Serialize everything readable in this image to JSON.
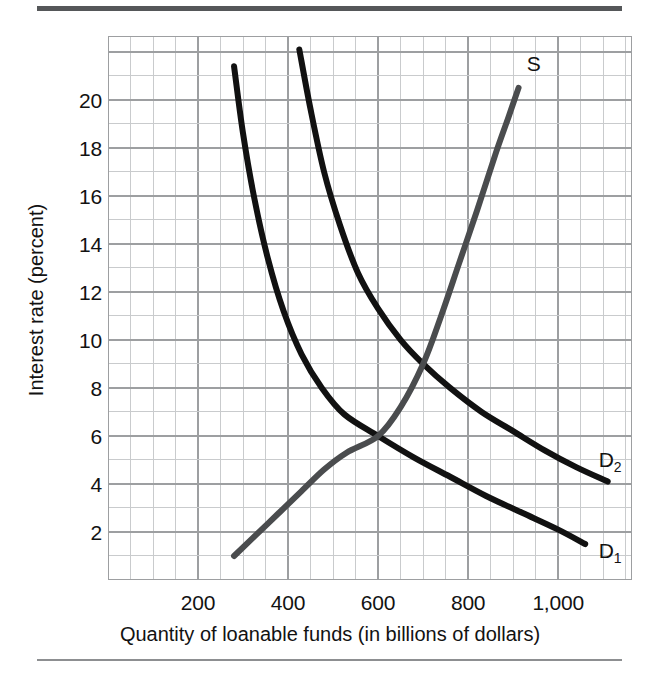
{
  "chart_data": {
    "type": "line",
    "title": "",
    "xlabel": "Quantity of loanable funds (in billions of dollars)",
    "ylabel": "Interest rate (percent)",
    "xlim": [
      0,
      1164
    ],
    "ylim": [
      0,
      22.66
    ],
    "xticks": [
      200,
      400,
      600,
      800,
      1000
    ],
    "xtick_labels": [
      "200",
      "400",
      "600",
      "800",
      "1,000"
    ],
    "yticks": [
      2,
      4,
      6,
      8,
      10,
      12,
      14,
      16,
      18,
      20
    ],
    "ytick_labels": [
      "2",
      "4",
      "6",
      "8",
      "10",
      "12",
      "14",
      "16",
      "18",
      "20"
    ],
    "grid": true,
    "grid_major_x_step": 200,
    "grid_major_y_step": 2,
    "grid_minor_x_step": 50,
    "grid_minor_y_step": 1,
    "legend_position": "inline-curve-end",
    "annotations": [
      {
        "text": "Equilibrium with D1",
        "x": 600,
        "y": 6
      },
      {
        "text": "Equilibrium with D2",
        "x": 700,
        "y": 9
      }
    ],
    "series": [
      {
        "name": "D1",
        "label": "D",
        "label_sub": "1",
        "role": "demand",
        "color": "#111111",
        "width": 6,
        "label_x": 1090,
        "label_y": 1.2,
        "points": [
          [
            280,
            21.4
          ],
          [
            300,
            18.6
          ],
          [
            325,
            15.9
          ],
          [
            355,
            13.4
          ],
          [
            390,
            11.2
          ],
          [
            430,
            9.4
          ],
          [
            475,
            8.0
          ],
          [
            525,
            6.9
          ],
          [
            600,
            6.0
          ],
          [
            680,
            5.1
          ],
          [
            760,
            4.3
          ],
          [
            840,
            3.5
          ],
          [
            920,
            2.8
          ],
          [
            1000,
            2.1
          ],
          [
            1060,
            1.5
          ]
        ]
      },
      {
        "name": "D2",
        "label": "D",
        "label_sub": "2",
        "role": "demand-shifted",
        "color": "#111111",
        "width": 6,
        "label_x": 1090,
        "label_y": 5.0,
        "points": [
          [
            425,
            22.1
          ],
          [
            450,
            19.6
          ],
          [
            480,
            17.0
          ],
          [
            515,
            14.8
          ],
          [
            555,
            12.8
          ],
          [
            600,
            11.3
          ],
          [
            650,
            10.0
          ],
          [
            700,
            9.0
          ],
          [
            760,
            8.0
          ],
          [
            830,
            7.0
          ],
          [
            900,
            6.2
          ],
          [
            970,
            5.4
          ],
          [
            1040,
            4.7
          ],
          [
            1110,
            4.1
          ]
        ]
      },
      {
        "name": "S",
        "label": "S",
        "label_sub": "",
        "role": "supply",
        "color": "#4a4c4e",
        "width": 6,
        "label_x": 930,
        "label_y": 21.5,
        "points": [
          [
            280,
            1.0
          ],
          [
            330,
            1.9
          ],
          [
            380,
            2.8
          ],
          [
            430,
            3.7
          ],
          [
            480,
            4.6
          ],
          [
            530,
            5.3
          ],
          [
            600,
            6.0
          ],
          [
            650,
            7.2
          ],
          [
            700,
            9.0
          ],
          [
            740,
            11.0
          ],
          [
            780,
            13.2
          ],
          [
            820,
            15.4
          ],
          [
            860,
            17.7
          ],
          [
            890,
            19.3
          ],
          [
            912,
            20.5
          ]
        ]
      }
    ]
  },
  "colors": {
    "grid_major": "#9d9fa1",
    "grid_minor": "#c9cbcd",
    "demand_curve": "#111111",
    "supply_curve": "#4a4c4e",
    "rule_top": "#555759",
    "rule_bottom": "#8d8f91",
    "text": "#121212",
    "background": "#ffffff"
  }
}
